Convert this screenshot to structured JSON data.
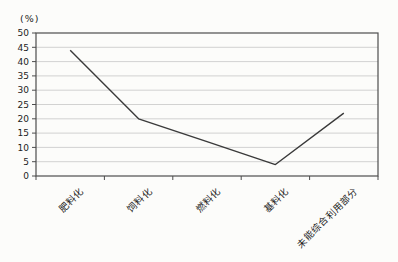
{
  "page": {
    "background": "#fcfcfa"
  },
  "chart_data": {
    "type": "line",
    "title": "",
    "unit_label": "(%)",
    "categories": [
      "肥料化",
      "饲料化",
      "燃料化",
      "基料化",
      "未能综合利用部分"
    ],
    "series": [
      {
        "name": "占比",
        "values": [
          44,
          20,
          12,
          4,
          22
        ]
      }
    ],
    "values": [
      44,
      20,
      12,
      4,
      22
    ],
    "xlabel": "",
    "ylabel": "(%)",
    "ylim": [
      0,
      50
    ],
    "ytick_step": 5,
    "yticks": [
      0,
      5,
      10,
      15,
      20,
      25,
      30,
      35,
      40,
      45,
      50
    ],
    "grid": true,
    "legend": "none",
    "x_label_rotation_deg": 45,
    "plot_frame": true,
    "colors": {
      "line": "#3a3a3a",
      "grid": "#c6c6c6",
      "axis": "#4d4d4d",
      "text": "#1c1c1c",
      "background": "#fcfcfa"
    }
  }
}
